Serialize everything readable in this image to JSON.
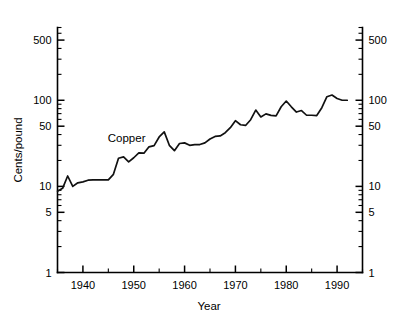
{
  "chart_data": {
    "type": "line",
    "title": "",
    "xlabel": "Year",
    "ylabel": "Cents/pound",
    "yscale": "log",
    "xscale": "linear",
    "xlim": [
      1935,
      1995
    ],
    "ylim": [
      1,
      700
    ],
    "grid": false,
    "legend_position": "inline-annotation",
    "y_tick_labels": [
      "1",
      "5",
      "10",
      "50",
      "100",
      "500"
    ],
    "y_tick_values": [
      1,
      5,
      10,
      50,
      100,
      500
    ],
    "y_minor_ticks": [
      2,
      3,
      4,
      6,
      7,
      8,
      9,
      20,
      30,
      40,
      60,
      70,
      80,
      90,
      200,
      300,
      400,
      600,
      700
    ],
    "x_tick_labels": [
      "1940",
      "1950",
      "1960",
      "1970",
      "1980",
      "1990"
    ],
    "x_tick_values": [
      1940,
      1950,
      1960,
      1970,
      1980,
      1990
    ],
    "x_minor_ticks": [
      1935,
      1945,
      1955,
      1965,
      1975,
      1985,
      1995
    ],
    "series": [
      {
        "name": "Copper",
        "annotation": "Copper",
        "annotation_x": 1948.6,
        "annotation_y": 33,
        "color": "#111111",
        "x": [
          1935,
          1936,
          1937,
          1938,
          1939,
          1940,
          1941,
          1942,
          1943,
          1944,
          1945,
          1946,
          1947,
          1948,
          1949,
          1950,
          1951,
          1952,
          1953,
          1954,
          1955,
          1956,
          1957,
          1958,
          1959,
          1960,
          1961,
          1962,
          1963,
          1964,
          1965,
          1966,
          1967,
          1968,
          1969,
          1970,
          1971,
          1972,
          1973,
          1974,
          1975,
          1976,
          1977,
          1978,
          1979,
          1980,
          1981,
          1982,
          1983,
          1984,
          1985,
          1986,
          1987,
          1988,
          1989,
          1990,
          1991,
          1992
        ],
        "values": [
          8.8,
          9.5,
          13.2,
          10.0,
          11.0,
          11.3,
          11.8,
          11.9,
          11.9,
          11.9,
          11.9,
          13.8,
          21.2,
          22.0,
          19.3,
          21.5,
          24.5,
          24.3,
          28.8,
          29.7,
          37.5,
          43.0,
          30.0,
          26.0,
          31.5,
          32.0,
          30.0,
          30.6,
          30.6,
          32.0,
          35.5,
          38.0,
          38.5,
          42.0,
          48.0,
          58.0,
          52.0,
          51.0,
          59.5,
          77.0,
          64.0,
          69.5,
          66.8,
          66.0,
          84.0,
          98.0,
          84.0,
          73.0,
          76.0,
          67.0,
          67.0,
          66.5,
          82.0,
          110.0,
          115.0,
          105.0,
          100.0,
          100.0
        ]
      }
    ]
  },
  "axis": {
    "x_title": "Year",
    "y_title": "Cents/pound"
  }
}
